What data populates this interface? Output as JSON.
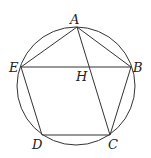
{
  "diagram": {
    "type": "geometry",
    "circle": {
      "cx": 76,
      "cy": 86,
      "r": 59
    },
    "points": {
      "A": {
        "x": 77,
        "y": 27,
        "label": "A"
      },
      "B": {
        "x": 131,
        "y": 67,
        "label": "B"
      },
      "C": {
        "x": 110,
        "y": 135,
        "label": "C"
      },
      "D": {
        "x": 42,
        "y": 135,
        "label": "D"
      },
      "E": {
        "x": 21,
        "y": 67,
        "label": "E"
      },
      "H": {
        "x": 89,
        "y": 67,
        "label": "H"
      }
    },
    "segments": [
      [
        "A",
        "B"
      ],
      [
        "B",
        "C"
      ],
      [
        "C",
        "D"
      ],
      [
        "D",
        "E"
      ],
      [
        "E",
        "A"
      ],
      [
        "E",
        "B"
      ],
      [
        "A",
        "C"
      ]
    ],
    "colors": {
      "stroke": "#333333",
      "text": "#222222",
      "background": "#ffffff"
    }
  }
}
